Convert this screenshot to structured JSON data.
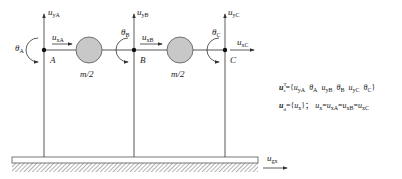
{
  "diagram": {
    "nodes": [
      {
        "id": "A",
        "label": "A",
        "x": 44,
        "y": 50,
        "theta": "θ",
        "theta_sub": "A",
        "uy": "u",
        "uy_sub": "yA",
        "ux": "u",
        "ux_sub": "xA"
      },
      {
        "id": "B",
        "label": "B",
        "x": 134,
        "y": 50,
        "theta": "θ",
        "theta_sub": "B",
        "uy": "u",
        "uy_sub": "yB",
        "ux": "u",
        "ux_sub": "xB"
      },
      {
        "id": "C",
        "label": "C",
        "x": 225,
        "y": 50,
        "theta": "θ",
        "theta_sub": "C",
        "uy": "u",
        "uy_sub": "yC",
        "ux": "u",
        "ux_sub": "xC"
      }
    ],
    "masses": [
      {
        "label": "m/2",
        "cx": 89,
        "cy": 50,
        "r": 13
      },
      {
        "label": "m/2",
        "cx": 180,
        "cy": 50,
        "r": 13
      }
    ],
    "ground_motion": {
      "symbol": "u",
      "sub": "gx"
    },
    "equations": {
      "eq1": {
        "lhs": "u",
        "lhs_sub": "s",
        "lhs_sup": "T",
        "rhs": "={u",
        "terms": [
          "yA",
          "θ",
          "A",
          "yB",
          "θ",
          "B",
          "yC",
          "θ",
          "C"
        ]
      },
      "eq2": {
        "lhs": "u",
        "lhs_sub": "d",
        "rhs": "={u",
        "rhs_sub": "x",
        "rhs_close": "}；",
        "relation": "u",
        "relation_sub": "x",
        "chain": [
          "xA",
          "xB",
          "xC"
        ]
      }
    },
    "colors": {
      "line": "#333333",
      "mass_fill": "#c8c8c8",
      "mass_stroke": "#555555",
      "ground_fill": "#ffffff",
      "hatch": "#666666"
    }
  }
}
